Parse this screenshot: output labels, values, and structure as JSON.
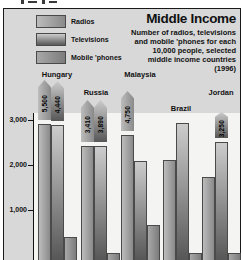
{
  "header": {
    "title": "Middle Income",
    "subtitle_lines": [
      "Number of radios, televisions",
      "and mobile 'phones for each",
      "10,000 people, selected",
      "middle income countries",
      "(1996)"
    ]
  },
  "colors": {
    "panel_bg": "#d8d8d8",
    "plot_bg": "#f4f4f2",
    "radios_light": "#bcbcbc",
    "radios_dark": "#8a8a8a",
    "tv_light": "#cccccc",
    "tv_dark": "#575757",
    "mobile_light": "#a8a8a8",
    "mobile_dark": "#7c7c7c"
  },
  "chart_data": {
    "type": "bar",
    "title": "Middle Income",
    "unit": "per 10,000 people",
    "categories": [
      "Radios",
      "Televisions",
      "Mobile 'phones"
    ],
    "y_ticks": [
      "3,000",
      "2,000",
      "1,000"
    ],
    "ylim_visible": [
      0,
      3300
    ],
    "grid": false,
    "legend_position": "top-left",
    "groups": [
      {
        "country": "Hungary",
        "values": [
          5500,
          4440,
          400
        ],
        "labels": [
          "5,500",
          "4,440",
          null
        ]
      },
      {
        "country": "Russia",
        "values": [
          3410,
          3890,
          45
        ],
        "labels": [
          "3,410",
          "3,890",
          null
        ]
      },
      {
        "country": "Malaysia",
        "values": [
          4750,
          2100,
          665
        ],
        "labels": [
          "4,750",
          null,
          null
        ]
      },
      {
        "country": "Brazil",
        "values": [
          2120,
          2930,
          45
        ],
        "labels": [
          null,
          null,
          null
        ]
      },
      {
        "country": "Jordan",
        "values": [
          1730,
          3250,
          45
        ],
        "labels": [
          null,
          "3,250",
          null
        ]
      }
    ]
  }
}
